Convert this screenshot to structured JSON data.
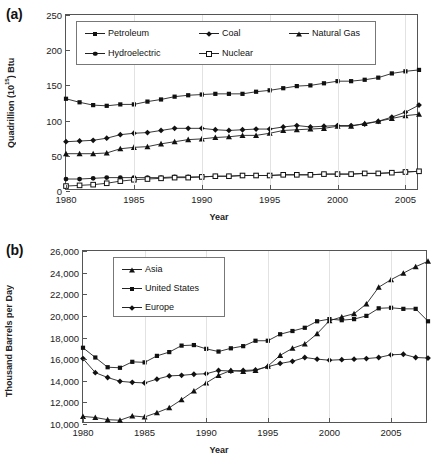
{
  "figure": {
    "panels": [
      {
        "label": "(a)"
      },
      {
        "label": "(b)"
      }
    ]
  },
  "chart_data": [
    {
      "type": "line",
      "panel": "(a)",
      "title": "",
      "xlabel": "Year",
      "ylabel": "Quadrillion (10¹⁵) Btu",
      "ylabel_prefix": "Quadrillion (10",
      "ylabel_exponent": "15",
      "ylabel_suffix": ") Btu",
      "xlim": [
        1980,
        2006
      ],
      "ylim": [
        0,
        250
      ],
      "yticks": [
        0,
        50,
        100,
        150,
        200,
        250
      ],
      "ytick_labels": [
        "0",
        "50",
        "100",
        "150",
        "200",
        "250"
      ],
      "xticks": [
        1980,
        1985,
        1990,
        1995,
        2000,
        2005
      ],
      "xtick_labels": [
        "1980",
        "1985",
        "1990",
        "1995",
        "2000",
        "2005"
      ],
      "grid": "vertical-only",
      "legend_position": "top-left-inside",
      "x": [
        1980,
        1981,
        1982,
        1983,
        1984,
        1985,
        1986,
        1987,
        1988,
        1989,
        1990,
        1991,
        1992,
        1993,
        1994,
        1995,
        1996,
        1997,
        1998,
        1999,
        2000,
        2001,
        2002,
        2003,
        2004,
        2005,
        2006
      ],
      "series": [
        {
          "name": "Petroleum",
          "marker": "square",
          "values": [
            131,
            126,
            122,
            121,
            123,
            123,
            127,
            130,
            134,
            136,
            137,
            138,
            138,
            138,
            141,
            143,
            146,
            149,
            150,
            153,
            156,
            156,
            158,
            161,
            167,
            170,
            172
          ]
        },
        {
          "name": "Coal",
          "marker": "diamond",
          "values": [
            70,
            71,
            72,
            75,
            80,
            82,
            83,
            86,
            89,
            89,
            89,
            87,
            86,
            87,
            88,
            88,
            91,
            93,
            91,
            92,
            93,
            93,
            95,
            99,
            105,
            112,
            122
          ]
        },
        {
          "name": "Natural Gas",
          "marker": "triangle",
          "values": [
            53,
            53,
            53,
            54,
            60,
            62,
            63,
            67,
            70,
            73,
            74,
            76,
            77,
            79,
            79,
            82,
            86,
            87,
            88,
            89,
            92,
            92,
            96,
            99,
            103,
            107,
            109
          ]
        },
        {
          "name": "Hydroelectric",
          "marker": "circle",
          "values": [
            17,
            17,
            18,
            19,
            19,
            19,
            19,
            19,
            20,
            20,
            20,
            21,
            21,
            22,
            22,
            22,
            23,
            23,
            23,
            24,
            24,
            24,
            25,
            25,
            26,
            27,
            28
          ]
        },
        {
          "name": "Nuclear",
          "marker": "open-square",
          "values": [
            7,
            8,
            9,
            11,
            14,
            16,
            17,
            18,
            19,
            19,
            20,
            21,
            21,
            22,
            22,
            22,
            23,
            23,
            23,
            24,
            24,
            24,
            25,
            25,
            26,
            27,
            28
          ]
        }
      ]
    },
    {
      "type": "line",
      "panel": "(b)",
      "title": "",
      "xlabel": "Year",
      "ylabel": "Thousand Barrels per Day",
      "xlim": [
        1980,
        2008
      ],
      "ylim": [
        10000,
        26000
      ],
      "yticks": [
        10000,
        12000,
        14000,
        16000,
        18000,
        20000,
        22000,
        24000,
        26000
      ],
      "ytick_labels": [
        "10,000",
        "12,000",
        "14,000",
        "16,000",
        "18,000",
        "20,000",
        "22,000",
        "24,000",
        "26,000"
      ],
      "xticks": [
        1980,
        1985,
        1990,
        1995,
        2000,
        2005
      ],
      "xtick_labels": [
        "1980",
        "1985",
        "1990",
        "1995",
        "2000",
        "2005"
      ],
      "grid": "vertical-only",
      "legend_position": "top-left-inside",
      "x": [
        1980,
        1981,
        1982,
        1983,
        1984,
        1985,
        1986,
        1987,
        1988,
        1989,
        1990,
        1991,
        1992,
        1993,
        1994,
        1995,
        1996,
        1997,
        1998,
        1999,
        2000,
        2001,
        2002,
        2003,
        2004,
        2005,
        2006,
        2007,
        2008
      ],
      "series": [
        {
          "name": "Asia",
          "marker": "triangle",
          "values": [
            10700,
            10600,
            10400,
            10350,
            10750,
            10650,
            11050,
            11500,
            12250,
            13050,
            13800,
            14500,
            14950,
            14850,
            14950,
            15350,
            16350,
            17000,
            17400,
            18350,
            19550,
            19900,
            20200,
            21100,
            22650,
            23350,
            23950,
            24550,
            25050
          ]
        },
        {
          "name": "United States",
          "marker": "square",
          "values": [
            17050,
            16150,
            15250,
            15200,
            15750,
            15700,
            16300,
            16650,
            17250,
            17300,
            16950,
            16700,
            17000,
            17200,
            17700,
            17700,
            18300,
            18600,
            18900,
            19500,
            19700,
            19600,
            19700,
            20000,
            20700,
            20750,
            20650,
            20650,
            19500
          ]
        },
        {
          "name": "Europe",
          "marker": "diamond",
          "values": [
            16050,
            14750,
            14300,
            13950,
            13850,
            13800,
            14150,
            14450,
            14500,
            14600,
            14650,
            14950,
            14900,
            14950,
            15000,
            15300,
            15600,
            15800,
            16150,
            16000,
            15900,
            15950,
            16000,
            16050,
            16150,
            16400,
            16450,
            16150,
            16100
          ]
        }
      ]
    }
  ]
}
